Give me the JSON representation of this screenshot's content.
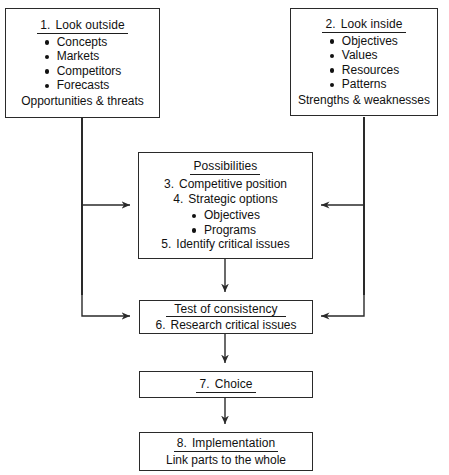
{
  "diagram": {
    "line_color": "#2a2a2a"
  },
  "boxes": {
    "look_outside": {
      "header_num": "1.",
      "header_text": "Look outside",
      "bullets": [
        "Concepts",
        "Markets",
        "Competitors",
        "Forecasts"
      ],
      "footer": "Opportunities & threats"
    },
    "look_inside": {
      "header_num": "2.",
      "header_text": "Look inside",
      "bullets": [
        "Objectives",
        "Values",
        "Resources",
        "Patterns"
      ],
      "footer": "Strengths & weaknesses"
    },
    "possibilities": {
      "header_text": "Possibilities",
      "item3_num": "3.",
      "item3_text": "Competitive position",
      "item4_num": "4.",
      "item4_text": "Strategic options",
      "bullets": [
        "Objectives",
        "Programs"
      ],
      "item5_num": "5.",
      "item5_text": "Identify critical issues"
    },
    "test_of_consistency": {
      "header_text": "Test of consistency",
      "item6_num": "6.",
      "item6_text": "Research critical issues"
    },
    "choice": {
      "header_num": "7.",
      "header_text": "Choice"
    },
    "implementation": {
      "header_num": "8.",
      "header_text": "Implementation",
      "footer": "Link parts to the whole"
    }
  }
}
